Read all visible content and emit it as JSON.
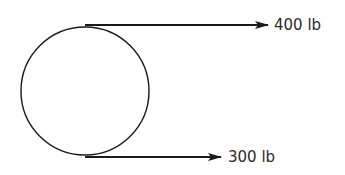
{
  "diagram": {
    "type": "free-body",
    "body": {
      "shape": "circle",
      "center": [
        85,
        91
      ],
      "radius": 64
    },
    "forces": [
      {
        "id": "top",
        "label": "400 lb",
        "y": 25,
        "x_start": 85,
        "x_end": 268,
        "direction": "right"
      },
      {
        "id": "bottom",
        "label": "300 lb",
        "y": 157,
        "x_start": 85,
        "x_end": 221,
        "direction": "right"
      }
    ],
    "colors": {
      "stroke": "#1a1a1a",
      "text": "#2a2a2a",
      "background": "#ffffff"
    }
  }
}
